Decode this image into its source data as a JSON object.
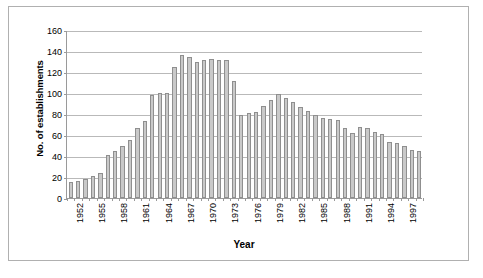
{
  "chart_data": {
    "type": "bar",
    "title": "",
    "xlabel": "Year",
    "ylabel": "No. of establishments",
    "ylim": [
      0,
      160
    ],
    "ytick_step": 20,
    "yticks": [
      0,
      20,
      40,
      60,
      80,
      100,
      120,
      140,
      160
    ],
    "grid": true,
    "legend": null,
    "xtick_labels_every": 3,
    "xtick_labels": [
      "1952",
      "1955",
      "1958",
      "1961",
      "1964",
      "1967",
      "1970",
      "1973",
      "1976",
      "1979",
      "1982",
      "1985",
      "1988",
      "1991",
      "1994",
      "1997"
    ],
    "categories": [
      "1952",
      "1953",
      "1954",
      "1955",
      "1956",
      "1957",
      "1958",
      "1959",
      "1960",
      "1961",
      "1962",
      "1963",
      "1964",
      "1965",
      "1966",
      "1967",
      "1968",
      "1969",
      "1970",
      "1971",
      "1972",
      "1973",
      "1974",
      "1975",
      "1976",
      "1977",
      "1978",
      "1979",
      "1980",
      "1981",
      "1982",
      "1983",
      "1984",
      "1985",
      "1986",
      "1987",
      "1988",
      "1989",
      "1990",
      "1991",
      "1992",
      "1993",
      "1994",
      "1995",
      "1996",
      "1997",
      "1998",
      "1999"
    ],
    "values": [
      15,
      16,
      18,
      21,
      24,
      41,
      45,
      50,
      55,
      67,
      73,
      98,
      100,
      100,
      125,
      136,
      134,
      130,
      131,
      132,
      131,
      131,
      111,
      79,
      81,
      82,
      88,
      93,
      99,
      95,
      91,
      87,
      83,
      79,
      76,
      75,
      74,
      67,
      62,
      68,
      67,
      63,
      61,
      53,
      52,
      50,
      46,
      45
    ],
    "bar_color": "#c9c9c9",
    "bar_border_color": "#8f8f8f",
    "gridline_color": "#b9b9b9",
    "axis_color": "#9a9a9a",
    "frame_color": "#b0b0b0",
    "background": "#ffffff"
  }
}
